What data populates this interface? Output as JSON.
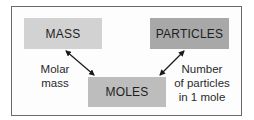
{
  "diagram": {
    "nodes": {
      "mass": "MASS",
      "particles": "PARTICLES",
      "moles": "MOLES"
    },
    "edges": [
      {
        "from": "MASS",
        "to": "MOLES",
        "label_lines": [
          "Molar",
          "mass"
        ],
        "bidirectional": true
      },
      {
        "from": "PARTICLES",
        "to": "MOLES",
        "label_lines": [
          "Number",
          "of particles",
          "in 1 mole"
        ],
        "bidirectional": true
      }
    ],
    "colors": {
      "mass_fill": "#d2d2d2",
      "particles_fill": "#a8a8a8",
      "moles_fill": "#bdbdbd",
      "frame_border": "#6a6a6a",
      "arrow": "#1a1a1a"
    }
  }
}
